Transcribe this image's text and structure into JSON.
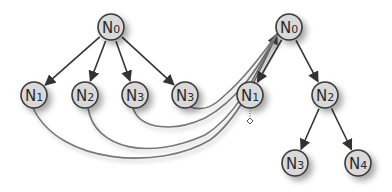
{
  "diagram": {
    "colors": {
      "background": "#ffffff",
      "node_fill": "#d9d9d9",
      "node_stroke": "#3a3a3a",
      "edge": "#333333",
      "curve": "#777777",
      "shadow": "#9a9a9a"
    },
    "node_radius": 13,
    "left_tree": {
      "nodes": [
        {
          "id": "L0",
          "base": "N",
          "sub": "0",
          "x": 111,
          "y": 27
        },
        {
          "id": "L1",
          "base": "N",
          "sub": "1",
          "x": 34,
          "y": 95
        },
        {
          "id": "L2",
          "base": "N",
          "sub": "2",
          "x": 85,
          "y": 95
        },
        {
          "id": "L3",
          "base": "N",
          "sub": "3",
          "x": 135,
          "y": 95
        },
        {
          "id": "L4",
          "base": "N",
          "sub": "3",
          "x": 185,
          "y": 95
        }
      ],
      "edges": [
        {
          "from": "L0",
          "to": "L1"
        },
        {
          "from": "L0",
          "to": "L2"
        },
        {
          "from": "L0",
          "to": "L3"
        },
        {
          "from": "L0",
          "to": "L4"
        }
      ]
    },
    "right_tree": {
      "nodes": [
        {
          "id": "R0",
          "base": "N",
          "sub": "0",
          "x": 289,
          "y": 27
        },
        {
          "id": "R1",
          "base": "N",
          "sub": "1",
          "x": 250,
          "y": 95
        },
        {
          "id": "R2",
          "base": "N",
          "sub": "2",
          "x": 325,
          "y": 95
        },
        {
          "id": "R3",
          "base": "N",
          "sub": "3",
          "x": 295,
          "y": 163
        },
        {
          "id": "R4",
          "base": "N",
          "sub": "4",
          "x": 358,
          "y": 163
        }
      ],
      "edges": [
        {
          "from": "R0",
          "to": "R1"
        },
        {
          "from": "R0",
          "to": "R2"
        },
        {
          "from": "R2",
          "to": "R3"
        },
        {
          "from": "R2",
          "to": "R4"
        }
      ],
      "marker": {
        "shape": "diamond",
        "x": 250,
        "y": 121
      }
    },
    "mapping_curves": [
      {
        "from": "L1",
        "to": "R0",
        "d": "M33,108 C60,165 160,170 210,140 C240,118 260,70 277,34"
      },
      {
        "from": "L2",
        "to": "R0",
        "d": "M88,108 C95,150 150,160 205,135 C238,115 258,70 277,34"
      },
      {
        "from": "L3",
        "to": "R0",
        "d": "M133,108 C140,130 175,132 205,118 C238,100 258,68 277,34"
      },
      {
        "from": "L4",
        "to": "R0",
        "d": "M190,107 C205,112 215,105 225,95 C245,78 262,55 277,34"
      }
    ]
  }
}
